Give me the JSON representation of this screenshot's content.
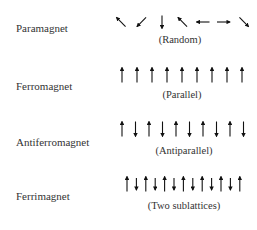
{
  "diagram": {
    "rows": [
      {
        "name": "Paramagnet",
        "caption": "(Random)",
        "arrows": [
          "up-left",
          "down-left",
          "down",
          "up-left",
          "left",
          "right",
          "down-right"
        ]
      },
      {
        "name": "Ferromagnet",
        "caption": "(Parallel)",
        "arrows": [
          "up",
          "up",
          "up",
          "up",
          "up",
          "up",
          "up",
          "up",
          "up"
        ]
      },
      {
        "name": "Antiferromagnet",
        "caption": "(Antiparallel)",
        "arrows": [
          "up",
          "down",
          "up",
          "down",
          "up",
          "down",
          "up",
          "down",
          "up",
          "down"
        ]
      },
      {
        "name": "Ferrimagnet",
        "caption": "(Two sublattices)",
        "arrows": [
          "up",
          "down-short",
          "up",
          "down-short",
          "up",
          "down-short",
          "up",
          "down-short",
          "up",
          "down-short",
          "up",
          "down-short",
          "up"
        ]
      }
    ],
    "arrow_color": "#111111"
  }
}
